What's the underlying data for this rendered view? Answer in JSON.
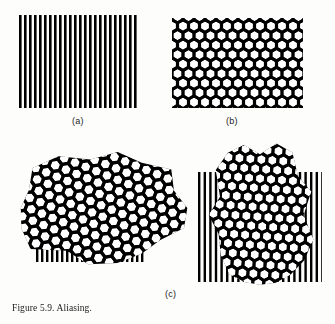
{
  "figure": {
    "caption": "Figure 5.9. Aliasing.",
    "background_color": "#fdfdfc",
    "ink_color": "#111111",
    "width": 335,
    "height": 324
  },
  "panels": [
    {
      "id": "a",
      "label": "(a)",
      "label_x": 72,
      "label_y": 116,
      "title": "vertical line grating",
      "content_type": "grating",
      "x": 19,
      "y": 15,
      "width": 118,
      "height": 93,
      "grating": {
        "orientation": "vertical",
        "period_px": 5.0,
        "bar_width_px": 2.6,
        "angle_deg": 0,
        "color": "#111111"
      }
    },
    {
      "id": "b",
      "label": "(b)",
      "label_x": 226,
      "label_y": 116,
      "title": "hexagonal mesh screen",
      "content_type": "hex-mesh",
      "x": 172,
      "y": 18,
      "width": 131,
      "height": 90,
      "mesh": {
        "lattice": "hexagonal",
        "cell_pitch_px": 11.0,
        "hole_shape": "hexagon",
        "hole_fill": "#ffffff",
        "mesh_fill": "#111111",
        "angle_deg": 0
      }
    },
    {
      "id": "c",
      "label": "(c)",
      "label_x": 165,
      "label_y": 289,
      "title": "superposition producing moire / aliasing",
      "content_type": "composite",
      "x": 15,
      "y": 140,
      "width": 305,
      "height": 145,
      "sub_figures": [
        {
          "id": "c-left",
          "note": "mesh rotated relative to grating",
          "x": 14,
          "y": 148,
          "width": 180,
          "height": 132,
          "grating": {
            "orientation": "vertical",
            "period_px": 5.0,
            "bar_width_px": 2.4,
            "angle_deg": 0,
            "x": 36,
            "y": 166,
            "width": 100,
            "height": 96
          },
          "mesh": {
            "lattice": "hexagonal",
            "cell_pitch_px": 11.5,
            "angle_deg": 22,
            "x": 14,
            "y": 148,
            "width": 178,
            "height": 120
          }
        },
        {
          "id": "c-right",
          "note": "mesh nearly aligned with grating",
          "x": 196,
          "y": 142,
          "width": 126,
          "height": 148,
          "grating": {
            "orientation": "vertical",
            "period_px": 5.6,
            "bar_width_px": 2.4,
            "angle_deg": 0,
            "x": 198,
            "y": 172,
            "width": 122,
            "height": 110
          },
          "mesh": {
            "lattice": "hexagonal",
            "cell_pitch_px": 11.0,
            "angle_deg": 4,
            "x": 208,
            "y": 142,
            "width": 104,
            "height": 146
          }
        }
      ]
    }
  ]
}
